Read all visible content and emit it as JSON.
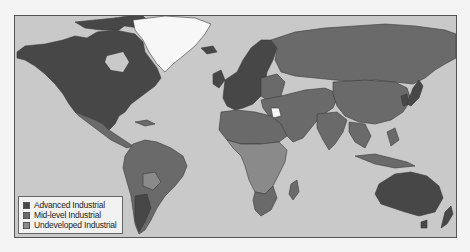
{
  "map": {
    "title": "World industrialization levels",
    "colors": {
      "ocean": "#c9c9c9",
      "advanced": "#474747",
      "mid": "#6a6a6a",
      "undeveloped": "#8a8a8a",
      "ice": "#f7f7f7",
      "border": "#3a3a3a"
    },
    "regions": {
      "advanced": [
        "North America",
        "Western Europe",
        "Japan",
        "Australia",
        "New Zealand",
        "South Korea"
      ],
      "mid": [
        "Russia",
        "China",
        "India",
        "Middle East",
        "Latin America",
        "Eastern Europe",
        "Southeast Asia",
        "Southern Africa",
        "North Africa"
      ],
      "undeveloped": [
        "Sub-Saharan Africa",
        "Central Africa",
        "Bolivia/Paraguay"
      ],
      "no_data": [
        "Greenland"
      ]
    }
  },
  "legend": {
    "items": [
      {
        "label": "Advanced Industrial",
        "color": "#474747"
      },
      {
        "label": "Mid-level Industrial",
        "color": "#6a6a6a"
      },
      {
        "label": "Undeveloped Industrial",
        "color": "#8a8a8a"
      }
    ]
  }
}
